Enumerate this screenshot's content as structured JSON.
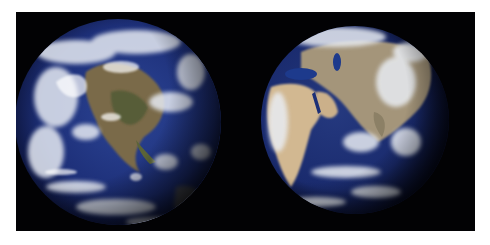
{
  "image": {
    "description": "Two satellite views of Earth side by side on a black background",
    "panels": [
      {
        "name": "western-hemisphere",
        "subject": "North America with cloud cover over Pacific and Atlantic"
      },
      {
        "name": "eastern-hemisphere",
        "subject": "Africa, Arabian Peninsula, Europe and Asia with Indian Ocean"
      }
    ],
    "colors": {
      "background": "#020204",
      "border": "#ffffff",
      "ocean": "#1c2d6e",
      "ocean_light": "#3a56a6",
      "land_desert": "#c9b08a",
      "land_green": "#5d6a3c",
      "cloud": "#e8ecf2"
    }
  }
}
